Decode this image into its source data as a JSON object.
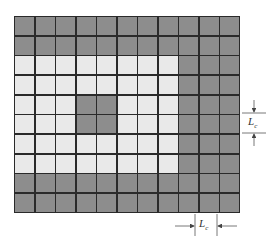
{
  "figure": {
    "grid": {
      "columns": 11,
      "rows": 10,
      "colors": {
        "dark": "#8d8d8d",
        "light": "#e9e9e9",
        "line": "#2a2a2a"
      },
      "pattern": [
        "DDDDDDDDDDD",
        "DDDDDDDDDDD",
        "LLLLLLLLDDD",
        "LLLLLLLLDDD",
        "LLLDDLLLDDD",
        "LLLDDLLLDDD",
        "LLLLLLLLDDD",
        "LLLLLLLLDDD",
        "DDDDDDDDDDD",
        "DDDDDDDDDDD"
      ]
    },
    "annotations": {
      "vertical_dimension": {
        "label": "L",
        "subscript": "c"
      },
      "horizontal_dimension": {
        "label": "L",
        "subscript": "c"
      }
    }
  }
}
